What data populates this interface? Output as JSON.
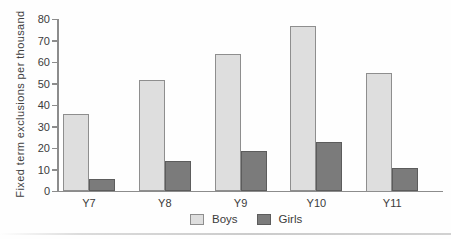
{
  "chart_data": {
    "type": "bar",
    "title": "",
    "xlabel": "",
    "ylabel": "Fixed term exclusions per thousand",
    "categories": [
      "Y7",
      "Y8",
      "Y9",
      "Y10",
      "Y11"
    ],
    "series": [
      {
        "name": "Boys",
        "values": [
          36,
          52,
          64,
          77,
          55
        ],
        "fill": "#dedede",
        "border": "#8e8e8e"
      },
      {
        "name": "Girls",
        "values": [
          6,
          14,
          19,
          23,
          11
        ],
        "fill": "#7b7b7b",
        "border": "#5c5c5c"
      }
    ],
    "ylim": [
      0,
      80
    ],
    "yticks": [
      0,
      10,
      20,
      30,
      40,
      50,
      60,
      70,
      80
    ],
    "grid": false,
    "legend_position": "bottom-center"
  },
  "colors": {
    "axis": "#8c8c8c",
    "text": "#3b3b3b",
    "background": "#fefefe"
  }
}
